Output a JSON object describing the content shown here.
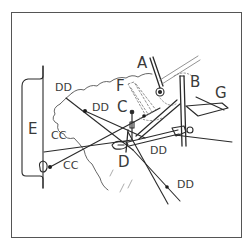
{
  "diagram": {
    "type": "mechanical-linkage-illustration",
    "colors": {
      "line": "#2a2a2a",
      "frame": "#555555",
      "dotted": "#777777",
      "background": "#ffffff"
    },
    "labels": {
      "A": "A",
      "B": "B",
      "C": "C",
      "D": "D",
      "E": "E",
      "F": "F",
      "G": "G",
      "dd_top": "DD",
      "dd_mid": "DD",
      "dd_right": "DD",
      "dd_bottom": "DD",
      "cc_upper": "CC",
      "cc_lower": "CC"
    }
  }
}
